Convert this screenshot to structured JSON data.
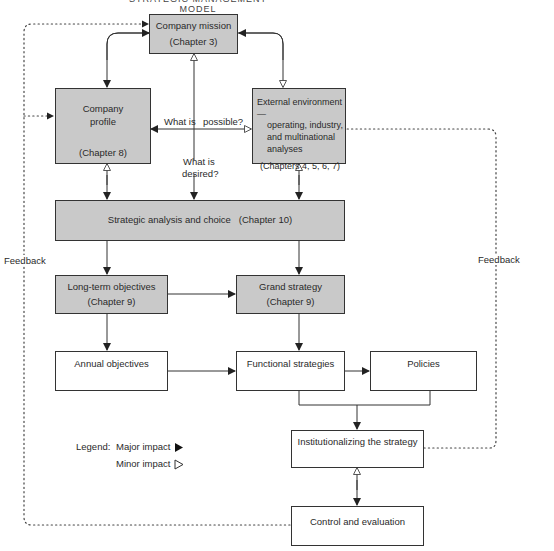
{
  "title": "STRATEGIC MANAGEMENT MODEL",
  "colors": {
    "major_box_fill": "#c9c9c9",
    "minor_box_fill": "#ffffff",
    "line": "#333333"
  },
  "boxes": {
    "mission": {
      "label": "Company mission",
      "chapter": "(Chapter 3)"
    },
    "profile": {
      "label_line1": "Company",
      "label_line2": "profile",
      "chapter": "(Chapter 8)"
    },
    "external": {
      "line1": "External environment—",
      "line2": "operating, industry,",
      "line3": "and multinational",
      "line4": "analyses",
      "chapter": "(Chapters 4, 5, 6, 7)"
    },
    "analysis": {
      "label": "Strategic analysis and choice   (Chapter 10)"
    },
    "longterm": {
      "label": "Long-term objectives",
      "chapter": "(Chapter 9)"
    },
    "grand": {
      "label": "Grand strategy",
      "chapter": "(Chapter 9)"
    },
    "annual": {
      "label": "Annual objectives"
    },
    "functional": {
      "label": "Functional strategies"
    },
    "policies": {
      "label": "Policies"
    },
    "institutionalizing": {
      "label": "Institutionalizing the strategy"
    },
    "control": {
      "label": "Control and evaluation"
    }
  },
  "annotations": {
    "what_is": "What is",
    "possible": "possible?",
    "desired_line1": "What is",
    "desired_line2": "desired?",
    "feedback_left": "Feedback",
    "feedback_right": "Feedback"
  },
  "legend": {
    "label": "Legend:",
    "major": "Major impact",
    "minor": "Minor impact",
    "major_icon": "filled-triangle",
    "minor_icon": "hollow-triangle"
  }
}
